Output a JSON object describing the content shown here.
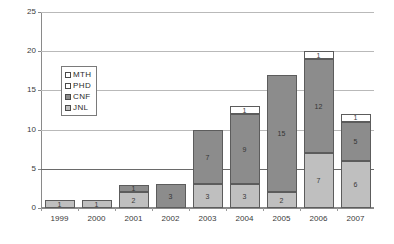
{
  "chart_data": {
    "type": "bar",
    "title": "",
    "subtitle": "",
    "xlabel": "",
    "ylabel": "",
    "stacked": true,
    "grid": true,
    "legend_position": "inside-left",
    "ylim": [
      0,
      25
    ],
    "yticks": [
      0,
      5,
      10,
      15,
      20,
      25
    ],
    "categories": [
      "1999",
      "2000",
      "2001",
      "2002",
      "2003",
      "2004",
      "2005",
      "2006",
      "2007"
    ],
    "series": [
      {
        "name": "JNL",
        "color": "#bfbfbf",
        "values": [
          1,
          1,
          2,
          0,
          3,
          3,
          2,
          7,
          6
        ]
      },
      {
        "name": "CNF",
        "color": "#8c8c8c",
        "values": [
          0,
          0,
          1,
          3,
          7,
          9,
          15,
          12,
          5
        ]
      },
      {
        "name": "PHD",
        "color": "#ffffff",
        "values": [
          0,
          0,
          0,
          0,
          0,
          1,
          0,
          1,
          1
        ]
      },
      {
        "name": "MTH",
        "color": "#ffffff",
        "values": [
          0,
          0,
          0,
          0,
          0,
          0,
          0,
          0,
          0
        ]
      }
    ],
    "totals": [
      1,
      1,
      3,
      3,
      10,
      13,
      17,
      20,
      12
    ],
    "legend_order": [
      "MTH",
      "PHD",
      "CNF",
      "JNL"
    ]
  },
  "axes": {
    "y_tick_labels": [
      "0",
      "5",
      "10",
      "15",
      "20",
      "25"
    ],
    "x_tick_labels": [
      "1999",
      "2000",
      "2001",
      "2002",
      "2003",
      "2004",
      "2005",
      "2006",
      "2007"
    ]
  },
  "legend": {
    "items": [
      {
        "label": "MTH",
        "key": "mth"
      },
      {
        "label": "PHD",
        "key": "phd"
      },
      {
        "label": "CNF",
        "key": "cnf"
      },
      {
        "label": "JNL",
        "key": "jnl"
      }
    ]
  }
}
